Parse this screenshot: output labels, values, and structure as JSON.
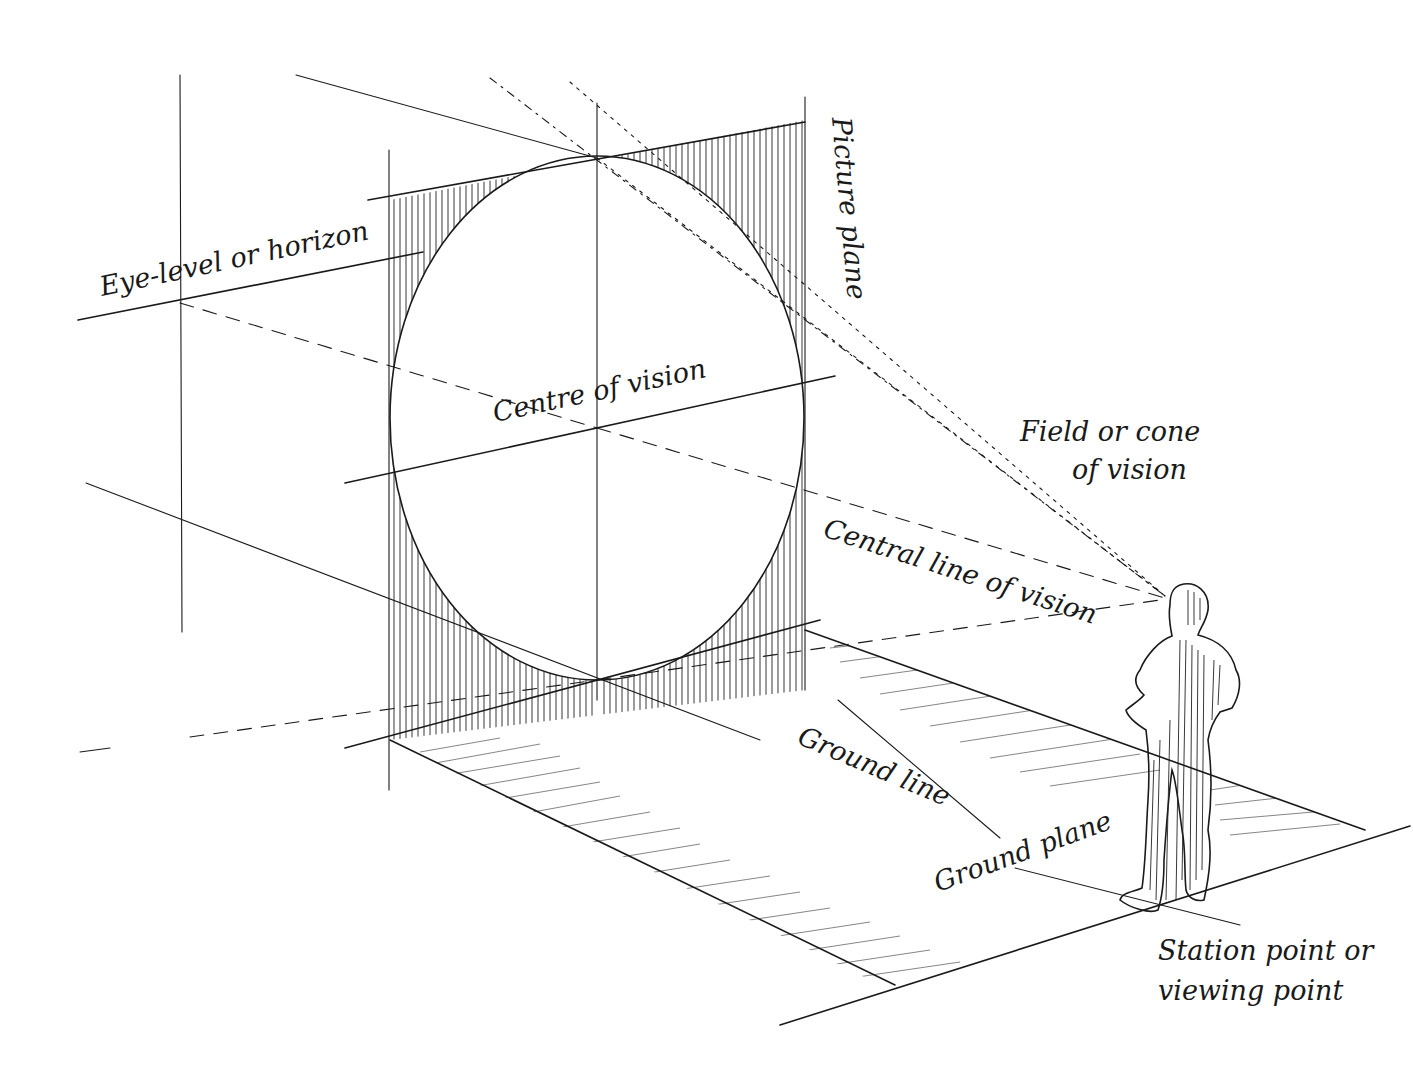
{
  "diagram": {
    "labels": {
      "eye_level": "Eye-level or horizon",
      "picture_plane": "Picture plane",
      "centre_of_vision": "Centre of vision",
      "field_of_vision_line1": "Field or cone",
      "field_of_vision_line2": "of vision",
      "central_line_of_vision": "Central line of vision",
      "ground_line": "Ground line",
      "ground_plane": "Ground plane",
      "station_point_line1": "Station point or",
      "station_point_line2": "viewing point"
    },
    "elements": [
      "picture-plane",
      "cone-of-vision-circle",
      "ground-plane",
      "viewer-figure",
      "horizon-line",
      "central-line-of-vision",
      "ground-line"
    ],
    "colors": {
      "ink": "#1a1a1a",
      "background": "#ffffff"
    }
  }
}
